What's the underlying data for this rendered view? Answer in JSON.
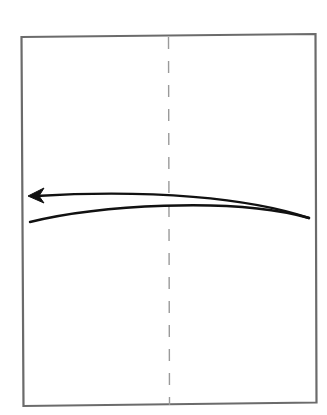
{
  "diagram": {
    "type": "origami-fold-step",
    "paper": {
      "shape": "rectangle",
      "edge_color": "#6b6b6b",
      "fill": "#ffffff"
    },
    "fold_line": {
      "style": "dashed",
      "orientation": "vertical",
      "position": "center",
      "color": "#9a9a9a"
    },
    "arrow": {
      "direction": "right-to-left",
      "style": "curved",
      "head": "left",
      "color": "#111111"
    }
  }
}
